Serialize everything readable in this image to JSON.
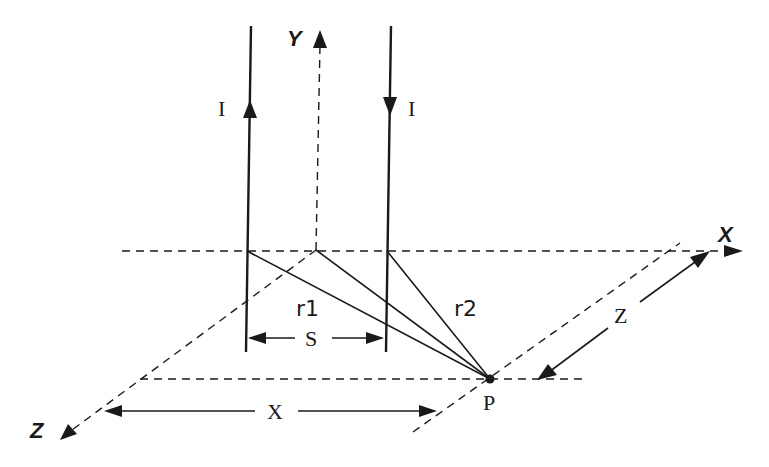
{
  "diagram": {
    "type": "3D coordinate geometry — two antiparallel current-carrying wires and field point P",
    "axes": {
      "x_label": "X",
      "y_label": "Y",
      "z_label": "Z"
    },
    "wires": [
      {
        "label": "I",
        "direction": "up"
      },
      {
        "label": "I",
        "direction": "down"
      }
    ],
    "distances": {
      "r1_label": "r1",
      "r2_label": "r2",
      "separation_label": "S",
      "x_dim_label": "X",
      "z_dim_label": "Z"
    },
    "point": {
      "label": "P"
    }
  }
}
